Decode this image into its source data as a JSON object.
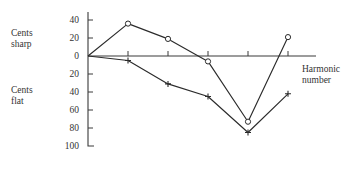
{
  "chart_data": {
    "type": "line",
    "title": "",
    "xlabel": "Harmonic number",
    "ylabel_top": "Cents sharp",
    "ylabel_bottom": "Cents flat",
    "grid": false,
    "legend": "none",
    "x": [
      1,
      2,
      3,
      4,
      5,
      6
    ],
    "ylim": [
      -100,
      45
    ],
    "y_tick_values": [
      40,
      20,
      0,
      -20,
      -40,
      -60,
      -80,
      -100
    ],
    "y_tick_labels": [
      "40",
      "20",
      "0",
      "20",
      "40",
      "60",
      "80",
      "100"
    ],
    "series": [
      {
        "name": "circle-series",
        "marker": "circle",
        "values": [
          0,
          36,
          19,
          -6,
          -73,
          21
        ]
      },
      {
        "name": "plus-series",
        "marker": "plus",
        "values": [
          0,
          -5,
          -31,
          -45,
          -85,
          -42
        ]
      }
    ]
  },
  "labels": {
    "cents_sharp_line1": "Cents",
    "cents_sharp_line2": "sharp",
    "cents_flat_line1": "Cents",
    "cents_flat_line2": "flat",
    "harmonic_line1": "Harmonic",
    "harmonic_line2": "number"
  },
  "colors": {
    "ink": "#2b2b2b",
    "axis": "#3a3a3a",
    "background": "#ffffff"
  }
}
